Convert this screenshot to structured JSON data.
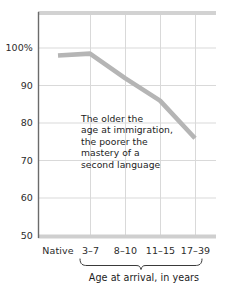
{
  "chart_data": {
    "type": "line",
    "title": "",
    "subtitle": "",
    "xlabel": "Age at arrival, in years",
    "ylabel": "",
    "categories": [
      "Native",
      "3–7",
      "8–10",
      "11–15",
      "17–39"
    ],
    "values": [
      98,
      98.5,
      92,
      86,
      76
    ],
    "series": [
      {
        "name": "Mastery of a second language",
        "values": [
          98,
          98.5,
          92,
          86,
          76
        ],
        "color": "#b5b5b5"
      }
    ],
    "ylim": [
      50,
      100
    ],
    "yticks": [
      100,
      90,
      80,
      70,
      60,
      50
    ],
    "ytick_labels": [
      "100%",
      "90",
      "80",
      "70",
      "60",
      "50"
    ],
    "grid": true,
    "legend": "none",
    "annotations": [
      {
        "name": "trend-note",
        "lines": [
          "The older the",
          "age at immigration,",
          "the poorer the",
          "mastery of a",
          "second language"
        ]
      }
    ],
    "axis_brace": {
      "label": "Age at arrival, in years",
      "covers": [
        "3–7",
        "8–10",
        "11–15",
        "17–39"
      ]
    },
    "colors": {
      "line": "#b5b5b5",
      "grid": "#d8d8d8",
      "axis_frame": "#d2d2d2",
      "axis_left": "#5a5a5a",
      "text": "#1c1c1c",
      "background": "#ffffff"
    }
  }
}
